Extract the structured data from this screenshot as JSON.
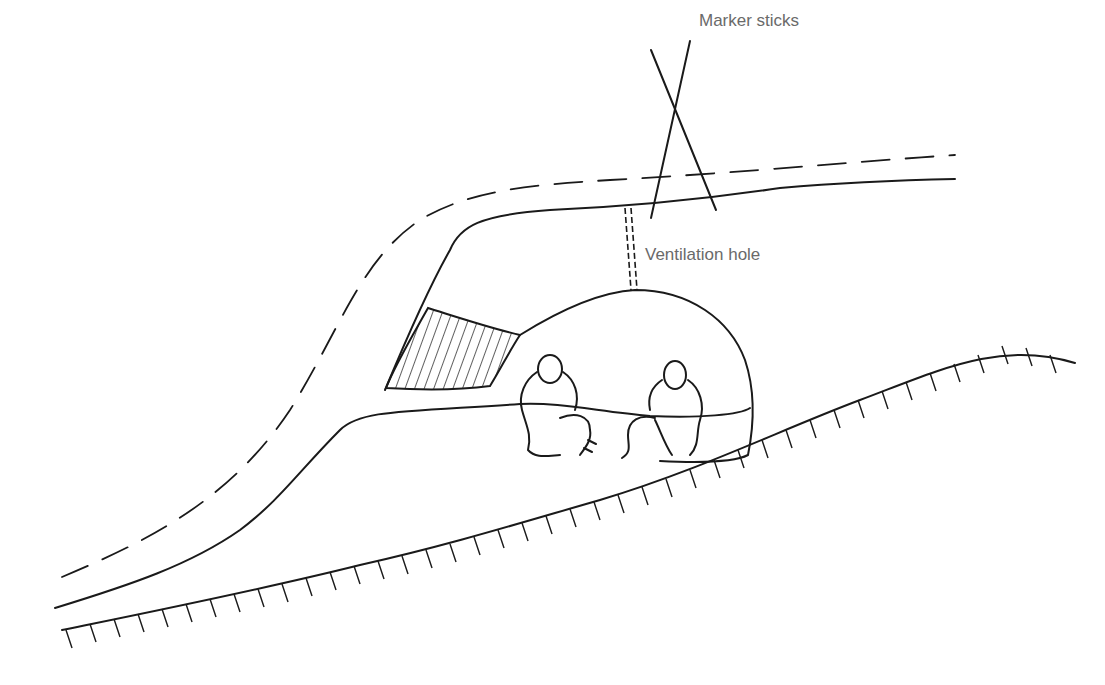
{
  "diagram": {
    "labels": {
      "marker_sticks": "Marker sticks",
      "ventilation_hole": "Ventilation hole"
    },
    "colors": {
      "ink": "#1a1a1a",
      "label_text": "#6a6a6a",
      "background": "#ffffff"
    },
    "elements": [
      "snow surface (dashed line)",
      "snow drift outline",
      "entrance tunnel",
      "hatched snow block (door)",
      "sleeping chamber dome",
      "two seated figures",
      "ground line with hatching",
      "crossed marker sticks",
      "ventilation hole"
    ]
  }
}
